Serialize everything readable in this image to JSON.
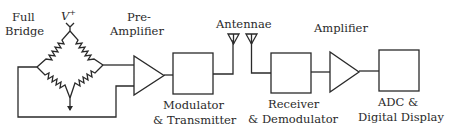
{
  "diagram": {
    "stroke_color": "#2a2a2a",
    "labels": {
      "bridge_line1": "Full",
      "bridge_line2": "Bridge",
      "supply": "V",
      "supply_sup": "+",
      "preamp_line1": "Pre-",
      "preamp_line2": "Amplifier",
      "antennae": "Antennae",
      "modulator_line1": "Modulator",
      "modulator_line2": "& Transmitter",
      "receiver_line1": "Receiver",
      "receiver_line2": "& Demodulator",
      "amplifier": "Amplifier",
      "adc_line1": "ADC &",
      "adc_line2": "Digital Display"
    },
    "blocks": [
      {
        "id": "full-bridge",
        "type": "wheatstone-bridge"
      },
      {
        "id": "pre-amplifier",
        "type": "amplifier-triangle"
      },
      {
        "id": "modulator-transmitter",
        "type": "box"
      },
      {
        "id": "antenna-tx",
        "type": "antenna"
      },
      {
        "id": "antenna-rx",
        "type": "antenna"
      },
      {
        "id": "receiver-demodulator",
        "type": "box"
      },
      {
        "id": "amplifier",
        "type": "amplifier-triangle"
      },
      {
        "id": "adc-digital-display",
        "type": "box"
      }
    ]
  }
}
